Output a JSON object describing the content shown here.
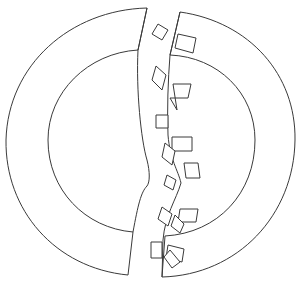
{
  "figure": {
    "stroke_color": "#3a3a3a",
    "background": "#ffffff"
  },
  "pieces": [
    {
      "id": "left-half",
      "outer_path": "M147,8 C70,10 8,65 6,140 C5,210 55,268 128,275 L133,232 C85,228 48,190 48,140 C48,92 88,53 138,50 Z",
      "crack_path": "M147,8 L138,50 C136,90 141,140 147,160 C150,172 150,182 147,186 C141,192 138,205 133,232"
    },
    {
      "id": "right-half",
      "outer_path": "M180,12 C250,22 296,75 295,140 C294,215 238,275 162,277 L165,236 C218,233 255,193 255,140 C255,93 218,57 170,55 Z",
      "crack_path": "M180,12 L170,55 C168,80 167,110 168,135 C170,160 178,170 181,183 C176,200 165,215 163,240 L162,277"
    }
  ],
  "fragments": [
    {
      "id": "frag-1",
      "points": "158,24 168,30 162,40 152,34"
    },
    {
      "id": "frag-2",
      "points": "178,34 196,38 193,53 175,48"
    },
    {
      "id": "frag-3",
      "points": "156,66 166,75 162,90 152,80"
    },
    {
      "id": "frag-4",
      "points": "173,84 191,84 188,98 170,98 177,110"
    },
    {
      "id": "frag-5",
      "points": "156,115 168,115 168,128 156,128"
    },
    {
      "id": "frag-6",
      "points": "172,137 192,137 192,151 172,151"
    },
    {
      "id": "frag-7",
      "points": "165,143 175,151 172,165 162,157"
    },
    {
      "id": "frag-8",
      "points": "184,163 198,163 200,178 186,178"
    },
    {
      "id": "frag-9",
      "points": "167,175 176,180 173,190 164,185"
    },
    {
      "id": "frag-10",
      "points": "180,209 198,209 196,222 178,222"
    },
    {
      "id": "frag-11",
      "points": "162,207 172,214 168,226 158,219"
    },
    {
      "id": "frag-12",
      "points": "175,215 184,224 180,233 171,226"
    },
    {
      "id": "frag-13",
      "points": "151,242 162,242 162,258 151,258"
    },
    {
      "id": "frag-14",
      "points": "168,245 184,249 182,262 166,258"
    },
    {
      "id": "frag-15",
      "points": "170,250 180,262 172,268 164,257"
    }
  ]
}
